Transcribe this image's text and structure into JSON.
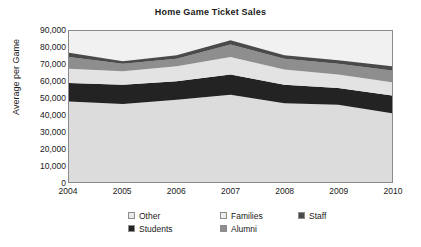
{
  "chart_data": {
    "type": "area",
    "title": "Home Game Ticket Sales",
    "xlabel": "",
    "ylabel": "Average per Game",
    "stacked": true,
    "grid": false,
    "legend_position": "bottom",
    "categories": [
      "2004",
      "2005",
      "2006",
      "2007",
      "2008",
      "2009",
      "2010"
    ],
    "x_tick_labels": [
      "2004",
      "2005",
      "2006",
      "2007",
      "2008",
      "2009",
      "2010"
    ],
    "y_tick_labels": [
      "90,000",
      "80,000",
      "70,000",
      "60,000",
      "50,000",
      "40,000",
      "30,000",
      "20,000",
      "10,000",
      "0"
    ],
    "ylim": [
      0,
      90000
    ],
    "y_tick_step": 10000,
    "series": [
      {
        "name": "Other",
        "color": "#dcdcdc",
        "values": [
          48000,
          46500,
          49000,
          52000,
          47000,
          46000,
          41000
        ]
      },
      {
        "name": "Students",
        "color": "#232323",
        "values": [
          11000,
          11500,
          11000,
          12000,
          11000,
          10000,
          10500
        ]
      },
      {
        "name": "Families",
        "color": "#e3e3e3",
        "values": [
          8500,
          8000,
          9000,
          10500,
          9000,
          8000,
          8000
        ]
      },
      {
        "name": "Alumni",
        "color": "#8e8e8e",
        "values": [
          7000,
          4500,
          4500,
          7500,
          6500,
          6500,
          7000
        ]
      },
      {
        "name": "Staff",
        "color": "#4a4a4a",
        "values": [
          2500,
          1500,
          2000,
          2500,
          2000,
          2000,
          2500
        ]
      }
    ],
    "stack_order_bottom_to_top": [
      "Other",
      "Students",
      "Families",
      "Alumni",
      "Staff"
    ],
    "stack_totals": [
      77000,
      72000,
      75500,
      84500,
      75500,
      72500,
      69000
    ]
  },
  "legend": {
    "row1": [
      {
        "label": "Other",
        "color": "#e8e8e8"
      },
      {
        "label": "Families",
        "color": "#ededed"
      },
      {
        "label": "Staff",
        "color": "#4a4a4a"
      }
    ],
    "row2": [
      {
        "label": "Students",
        "color": "#232323"
      },
      {
        "label": "Alumni",
        "color": "#8e8e8e"
      }
    ]
  },
  "plot": {
    "background_color": "#f1f1f1",
    "border_color": "#8a8a8a"
  }
}
